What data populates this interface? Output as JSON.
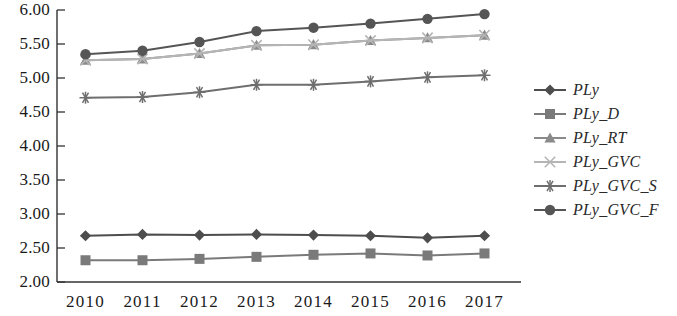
{
  "chart_data": {
    "type": "line",
    "title": "",
    "xlabel": "",
    "ylabel": "",
    "categories": [
      "2010",
      "2011",
      "2012",
      "2013",
      "2014",
      "2015",
      "2016",
      "2017"
    ],
    "ylim": [
      2.0,
      6.0
    ],
    "ytick_labels": [
      "2.00",
      "2.50",
      "3.00",
      "3.50",
      "4.00",
      "4.50",
      "5.00",
      "5.50",
      "6.00"
    ],
    "ytick_values": [
      2.0,
      2.5,
      3.0,
      3.5,
      4.0,
      4.5,
      5.0,
      5.5,
      6.0
    ],
    "grid": false,
    "legend_position": "right",
    "series": [
      {
        "name": "PLy",
        "marker": "diamond",
        "color": "#4d4d4d",
        "values": [
          2.68,
          2.7,
          2.69,
          2.7,
          2.69,
          2.68,
          2.65,
          2.68
        ]
      },
      {
        "name": "PLy_D",
        "marker": "square",
        "color": "#7a7a7a",
        "values": [
          2.32,
          2.32,
          2.34,
          2.37,
          2.4,
          2.42,
          2.39,
          2.42
        ]
      },
      {
        "name": "PLy_RT",
        "marker": "triangle",
        "color": "#8a8a8a",
        "values": [
          5.26,
          5.28,
          5.36,
          5.48,
          5.49,
          5.55,
          5.59,
          5.63
        ]
      },
      {
        "name": "PLy_GVC",
        "marker": "x",
        "color": "#b5b5b5",
        "values": [
          5.26,
          5.28,
          5.36,
          5.48,
          5.49,
          5.55,
          5.59,
          5.63
        ]
      },
      {
        "name": "PLy_GVC_S",
        "marker": "asterisk",
        "color": "#6e6e6e",
        "values": [
          4.71,
          4.72,
          4.79,
          4.9,
          4.9,
          4.95,
          5.01,
          5.04
        ]
      },
      {
        "name": "PLy_GVC_F",
        "marker": "circle",
        "color": "#555555",
        "values": [
          5.35,
          5.4,
          5.53,
          5.69,
          5.74,
          5.8,
          5.87,
          5.94
        ]
      }
    ]
  },
  "axis": {
    "color": "#333333"
  }
}
